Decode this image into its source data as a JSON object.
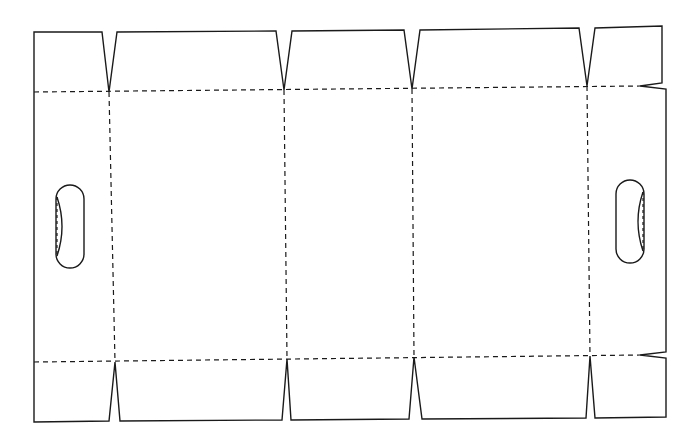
{
  "diagram": {
    "colors": {
      "line": "#1a1a1a",
      "background": "#ffffff"
    },
    "outline": {
      "points": "34,32 102,32 109,92 117,32 276,31 284,90 292,31 404,30 412,89 420,30 579,28 587,86 595,28 662,26 662,83 640,86 666,89 666,352 640,355 666,358 666,417 595,418 590,356 586,418 422,419 414,357 409,419 291,420 287,359 282,420 120,421 115,362 109,421 34,422"
    },
    "score_lines": {
      "top": "34,92 640,86",
      "bottom": "34,362 640,355",
      "verticals": [
        "109,92 115,362",
        "284,90 287,359",
        "412,89 414,357",
        "587,86 590,356"
      ]
    },
    "hand_holes": [
      {
        "name": "left-hand-hole",
        "cx": 70,
        "top": 185,
        "bottom": 268,
        "rx": 14,
        "dashed_x": 57,
        "dashed_side": "left"
      },
      {
        "name": "right-hand-hole",
        "cx": 630,
        "top": 180,
        "bottom": 263,
        "rx": 14,
        "dashed_x": 643,
        "dashed_side": "right"
      }
    ]
  }
}
